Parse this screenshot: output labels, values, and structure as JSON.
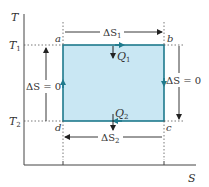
{
  "diagram": {
    "axes": {
      "y_label": "T",
      "x_label": "S"
    },
    "temperatures": {
      "hot": {
        "symbol": "T",
        "sub": "1"
      },
      "cold": {
        "symbol": "T",
        "sub": "2"
      }
    },
    "corners": {
      "a": "a",
      "b": "b",
      "c": "c",
      "d": "d"
    },
    "entropy_changes": {
      "top": {
        "delta": "ΔS",
        "sub": "1"
      },
      "bottom": {
        "delta": "ΔS",
        "sub": "2"
      },
      "left": "ΔS = 0",
      "right": "ΔS = 0"
    },
    "heats": {
      "q1": {
        "symbol": "Q",
        "sub": "1"
      },
      "q2": {
        "symbol": "Q",
        "sub": "2"
      }
    },
    "colors": {
      "fill": "#c9e7f3",
      "cycle_line": "#1f7a8c",
      "axis": "#444444",
      "arrow": "#222222",
      "dotted": "#555555"
    }
  }
}
